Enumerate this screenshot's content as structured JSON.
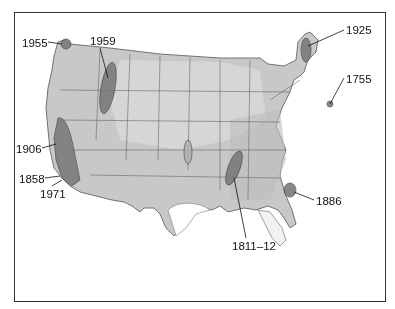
{
  "map": {
    "subject": "United States earthquake zones",
    "labels": [
      {
        "id": "1955",
        "text": "1955",
        "x": 22,
        "y": 38
      },
      {
        "id": "1959",
        "text": "1959",
        "x": 90,
        "y": 36
      },
      {
        "id": "1906",
        "text": "1906",
        "x": 16,
        "y": 144
      },
      {
        "id": "1858",
        "text": "1858",
        "x": 19,
        "y": 174
      },
      {
        "id": "1971",
        "text": "1971",
        "x": 40,
        "y": 189
      },
      {
        "id": "1925",
        "text": "1925",
        "x": 346,
        "y": 25
      },
      {
        "id": "1755",
        "text": "1755",
        "x": 346,
        "y": 74
      },
      {
        "id": "1886",
        "text": "1886",
        "x": 316,
        "y": 196
      },
      {
        "id": "1811-12",
        "text": "1811–12",
        "x": 232,
        "y": 241
      }
    ]
  }
}
